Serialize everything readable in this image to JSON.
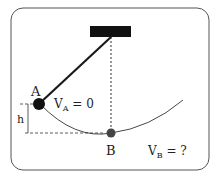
{
  "diagram": {
    "type": "pendulum",
    "labels": {
      "point_a": "A",
      "point_b": "B",
      "height": "h",
      "va_main": "V",
      "va_sub": "A",
      "va_eq": " = 0",
      "vb_main": "V",
      "vb_sub": "B",
      "vb_eq": " = ?"
    },
    "colors": {
      "frame": "#555555",
      "rod": "#1a1a1a",
      "ball_a": "#111111",
      "ball_b": "#444444",
      "ceiling": "#111111"
    }
  }
}
